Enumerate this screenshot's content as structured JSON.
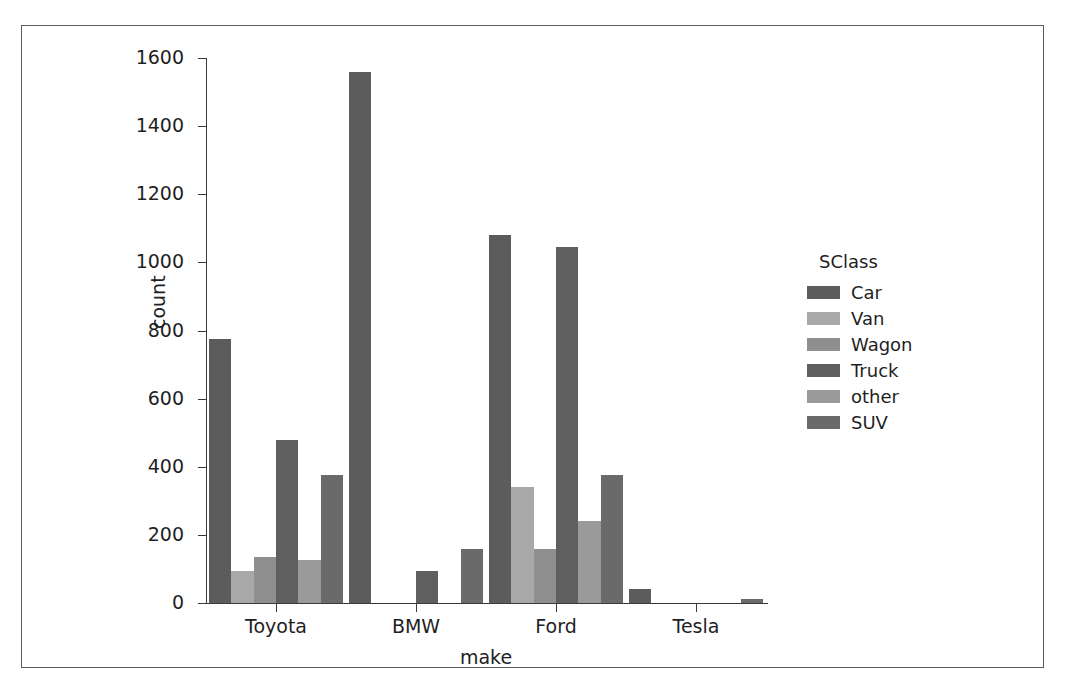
{
  "chart_data": {
    "type": "bar",
    "title": "",
    "xlabel": "make",
    "ylabel": "count",
    "categories": [
      "Toyota",
      "BMW",
      "Ford",
      "Tesla"
    ],
    "legend_title": "SClass",
    "legend_position": "right",
    "grid": false,
    "ylim": [
      0,
      1600
    ],
    "yticks": [
      0,
      200,
      400,
      600,
      800,
      1000,
      1200,
      1400,
      1600
    ],
    "ytick_labels": [
      "0",
      "200",
      "400",
      "600",
      "800",
      "1000",
      "1200",
      "1400",
      "1600"
    ],
    "series": [
      {
        "name": "Car",
        "color": "#5c5c5c",
        "values": [
          775,
          1560,
          1080,
          40
        ]
      },
      {
        "name": "Van",
        "color": "#a8a8a8",
        "values": [
          95,
          0,
          340,
          0
        ]
      },
      {
        "name": "Wagon",
        "color": "#8f8f8f",
        "values": [
          135,
          0,
          160,
          0
        ]
      },
      {
        "name": "Truck",
        "color": "#5f5f5f",
        "values": [
          480,
          95,
          1045,
          0
        ]
      },
      {
        "name": "other",
        "color": "#9a9a9a",
        "values": [
          125,
          0,
          240,
          0
        ]
      },
      {
        "name": "SUV",
        "color": "#6a6a6a",
        "values": [
          375,
          160,
          375,
          12
        ]
      }
    ]
  },
  "axis": {
    "left_color": "#3a3a3a",
    "bottom_color": "#3a3a3a"
  },
  "figure": {
    "background": "#ffffff",
    "border_color": "#5b5b5b"
  }
}
